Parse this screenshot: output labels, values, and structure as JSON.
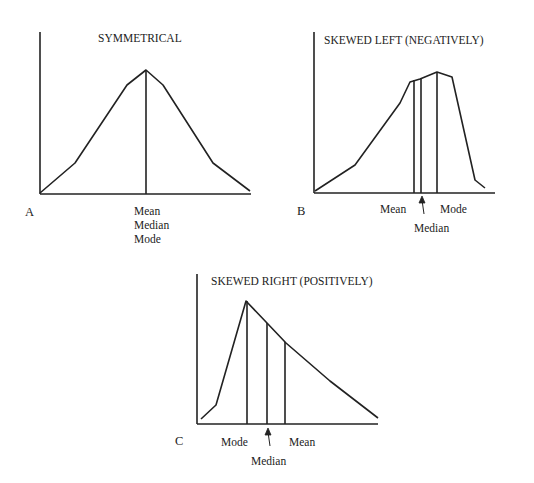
{
  "panels": {
    "a": {
      "letter": "A",
      "title": "SYMMETRICAL",
      "labels": {
        "mean": "Mean",
        "median": "Median",
        "mode": "Mode"
      },
      "curve": [
        [
          40,
          193
        ],
        [
          75,
          163
        ],
        [
          127,
          85
        ],
        [
          146,
          70
        ],
        [
          163,
          85
        ],
        [
          213,
          163
        ],
        [
          250,
          191
        ]
      ],
      "markers": [
        {
          "name": "mean-median-mode",
          "x": 146,
          "y": 70
        }
      ]
    },
    "b": {
      "letter": "B",
      "title": "SKEWED LEFT (NEGATIVELY)",
      "labels": {
        "mean": "Mean",
        "median": "Median",
        "mode": "Mode"
      },
      "curve": [
        [
          315,
          191
        ],
        [
          355,
          165
        ],
        [
          400,
          103
        ],
        [
          410,
          82
        ],
        [
          420,
          79
        ],
        [
          437,
          72
        ],
        [
          452,
          77
        ],
        [
          475,
          180
        ],
        [
          485,
          188
        ]
      ],
      "markers": [
        {
          "name": "mean",
          "x": 414,
          "y": 80
        },
        {
          "name": "median",
          "x": 421,
          "y": 79
        },
        {
          "name": "mode",
          "x": 437,
          "y": 72
        }
      ]
    },
    "c": {
      "letter": "C",
      "title": "SKEWED RIGHT (POSITIVELY)",
      "labels": {
        "mean": "Mean",
        "median": "Median",
        "mode": "Mode"
      },
      "curve": [
        [
          201,
          419
        ],
        [
          216,
          405
        ],
        [
          246,
          301
        ],
        [
          267,
          323
        ],
        [
          286,
          343
        ],
        [
          330,
          381
        ],
        [
          378,
          418
        ]
      ],
      "markers": [
        {
          "name": "mode",
          "x": 247,
          "y": 301
        },
        {
          "name": "median",
          "x": 267,
          "y": 323
        },
        {
          "name": "mean",
          "x": 285,
          "y": 342
        }
      ]
    }
  },
  "colors": {
    "ink": "#222222",
    "background": "#ffffff"
  }
}
